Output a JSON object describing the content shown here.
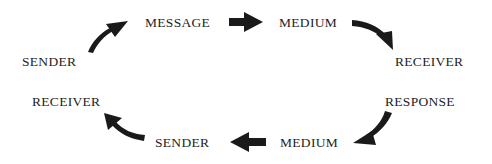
{
  "diagram": {
    "type": "communication-cycle",
    "colors": {
      "text": "#1e1e1e",
      "arrow": "#1a1a1a",
      "background": "#ffffff"
    },
    "nodes": [
      {
        "id": "sender_top",
        "label": "SENDER",
        "x": 22,
        "y": 55
      },
      {
        "id": "message",
        "label": "MESSAGE",
        "x": 145,
        "y": 16
      },
      {
        "id": "medium_top",
        "label": "MEDIUM",
        "x": 279,
        "y": 16
      },
      {
        "id": "receiver_right",
        "label": "RECEIVER",
        "x": 395,
        "y": 55
      },
      {
        "id": "response",
        "label": "RESPONSE",
        "x": 385,
        "y": 95
      },
      {
        "id": "medium_bottom",
        "label": "MEDIUM",
        "x": 280,
        "y": 136
      },
      {
        "id": "sender_bottom",
        "label": "SENDER",
        "x": 155,
        "y": 136
      },
      {
        "id": "receiver_left",
        "label": "RECEIVER",
        "x": 32,
        "y": 95
      }
    ],
    "edges": [
      {
        "from": "sender_top",
        "to": "message",
        "icon": "curved-arrow-up-right-icon"
      },
      {
        "from": "message",
        "to": "medium_top",
        "icon": "arrow-right-icon"
      },
      {
        "from": "medium_top",
        "to": "receiver_right",
        "icon": "curved-arrow-down-right-icon"
      },
      {
        "from": "response",
        "to": "medium_bottom",
        "icon": "curved-arrow-down-left-icon"
      },
      {
        "from": "medium_bottom",
        "to": "sender_bottom",
        "icon": "arrow-left-icon"
      },
      {
        "from": "sender_bottom",
        "to": "receiver_left",
        "icon": "curved-arrow-up-left-icon"
      }
    ]
  }
}
